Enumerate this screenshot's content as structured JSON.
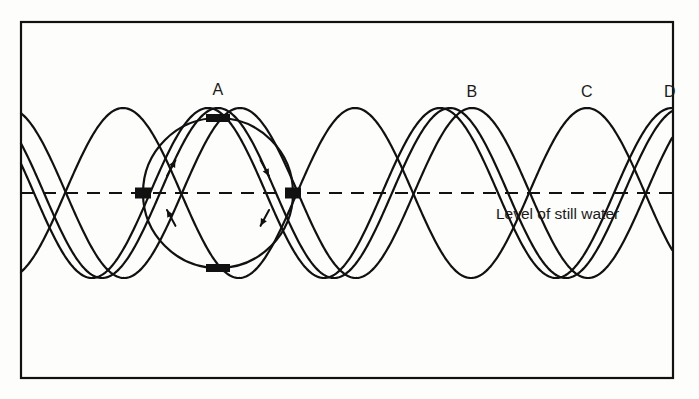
{
  "figure": {
    "background_color": "#fdfdfc",
    "stroke_color": "#111111",
    "frame": {
      "x": 21,
      "y": 22,
      "width": 652,
      "height": 356,
      "stroke_width": 2.2
    }
  },
  "still_water": {
    "caption": "Level of still water",
    "caption_x": 496,
    "caption_y": 205,
    "line_y": 193,
    "line_x_start": 21,
    "line_x_end": 673,
    "dash_pattern": "13,9",
    "stroke_width": 2.2
  },
  "chart_data": {
    "type": "line",
    "title": "",
    "xlabel": "",
    "ylabel": "",
    "grid": false,
    "legend": "none",
    "xlim": [
      21,
      673
    ],
    "ylim": [
      108,
      278
    ],
    "baseline_y": 193,
    "amplitude": 85,
    "wavelength": 232,
    "series": [
      {
        "name": "wave-1",
        "crest_label": "A",
        "crest_x": 218,
        "phase_offset": 0,
        "stroke_width": 2.2
      },
      {
        "name": "wave-2",
        "crest_label": "B",
        "crest_x": 472,
        "phase_offset": 254,
        "stroke_width": 2.2
      },
      {
        "name": "wave-3",
        "crest_label": "C",
        "crest_x": 587,
        "phase_offset": 369,
        "stroke_width": 2.2
      },
      {
        "name": "wave-4",
        "crest_label": "D",
        "crest_x": 672,
        "phase_offset": 454,
        "stroke_width": 2.2
      }
    ],
    "crest_labels": [
      {
        "text": "A",
        "x": 218,
        "y": 90
      },
      {
        "text": "B",
        "x": 472,
        "y": 92
      },
      {
        "text": "C",
        "x": 587,
        "y": 92
      },
      {
        "text": "D",
        "x": 670,
        "y": 92
      }
    ]
  },
  "orbit": {
    "center_x": 218,
    "center_y": 193,
    "radius": 75,
    "stroke_width": 2.2,
    "rotation": "clockwise",
    "arrows": [
      {
        "name": "arrow-upper-left",
        "angle_deg": 208,
        "direction": "clockwise"
      },
      {
        "name": "arrow-upper-right",
        "angle_deg": 332,
        "direction": "clockwise"
      },
      {
        "name": "arrow-lower-left",
        "angle_deg": 152,
        "direction": "clockwise"
      },
      {
        "name": "arrow-lower-right",
        "angle_deg": 28,
        "direction": "clockwise"
      }
    ],
    "markers": [
      {
        "name": "marker-top",
        "angle_deg": 270,
        "width": 24,
        "height": 8
      },
      {
        "name": "marker-bottom",
        "angle_deg": 90,
        "width": 24,
        "height": 8
      },
      {
        "name": "marker-left",
        "angle_deg": 180,
        "width": 16,
        "height": 11
      },
      {
        "name": "marker-right",
        "angle_deg": 0,
        "width": 16,
        "height": 11
      }
    ]
  }
}
